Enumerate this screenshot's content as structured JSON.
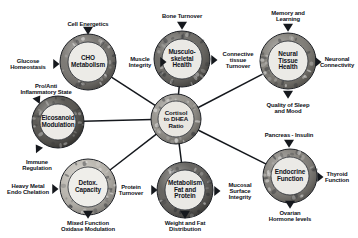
{
  "figure": {
    "background": "#ffffff",
    "text_color": "#10131a",
    "line_color": "#15181d"
  },
  "hub": {
    "id": "cortisol-dhea-ratio",
    "label": "Cortisol\nto DHEA\nRatio",
    "cx": 176,
    "cy": 119,
    "r_outer": 25,
    "r_inner": 18,
    "ring_fill": "#8e8b84",
    "center_fill": "#e9e7e1"
  },
  "nodes": [
    {
      "id": "cho-metabolism",
      "label": "CHO\nMetabolism",
      "cx": 88,
      "cy": 62,
      "r_outer": 28,
      "r_inner": 20,
      "ring_fill": "#6f6c67",
      "center_fill": "#ecebe7",
      "leaves": [
        {
          "id": "cell-energetics",
          "label": "Cell Energetics",
          "angle": -90,
          "lx": 88,
          "ly": 24,
          "ax": 88,
          "ay": 32,
          "dir": "down"
        },
        {
          "id": "glucose-homeostasis",
          "label": "Glucose\nHomeostasis",
          "angle": 180,
          "lx": 28,
          "ly": 64,
          "ax": 56,
          "ay": 64,
          "dir": "right"
        },
        {
          "id": "muscle-integrity",
          "label": "Muscle\nIntegrity",
          "angle": 0,
          "lx": 140,
          "ly": 62,
          "ax": 163,
          "ay": 62,
          "dir": "right"
        }
      ]
    },
    {
      "id": "musculoskeletal-health",
      "label": "Musculo-\nskeletal\nHealth",
      "cx": 182,
      "cy": 59,
      "r_outer": 28,
      "r_inner": 20,
      "ring_fill": "#5f5d58",
      "center_fill": "#eae9e5",
      "leaves": [
        {
          "id": "bone-turnover",
          "label": "Bone Turnover",
          "angle": -90,
          "lx": 182,
          "ly": 16,
          "ax": 182,
          "ay": 27,
          "dir": "down"
        },
        {
          "id": "muscle-integrity-ms",
          "label": "",
          "angle": 180,
          "lx": 0,
          "ly": 0,
          "ax": 0,
          "ay": 0,
          "dir": "none"
        },
        {
          "id": "connective-tissue-turnover",
          "label": "Connective\ntissue\nTurnover",
          "angle": 0,
          "lx": 238,
          "ly": 60,
          "ax": 214,
          "ay": 60,
          "dir": "right"
        }
      ]
    },
    {
      "id": "neural-tissue-health",
      "label": "Neural\nTissue\nHealth",
      "cx": 288,
      "cy": 61,
      "r_outer": 28,
      "r_inner": 20,
      "ring_fill": "#77746d",
      "center_fill": "#ebeae6",
      "leaves": [
        {
          "id": "memory-and-learning",
          "label": "Memory and\nLearning",
          "angle": -90,
          "lx": 288,
          "ly": 16,
          "ax": 288,
          "ay": 29,
          "dir": "down"
        },
        {
          "id": "neuronal-connectivity",
          "label": "Neuronal\nConnectivity",
          "angle": 0,
          "lx": 337,
          "ly": 62,
          "ax": 318,
          "ay": 62,
          "dir": "right"
        },
        {
          "id": "quality-of-sleep-and-mood",
          "label": "Quality of Sleep\nand Mood",
          "angle": 90,
          "lx": 288,
          "ly": 108,
          "ax": 288,
          "ay": 96,
          "dir": "down"
        }
      ]
    },
    {
      "id": "eicosanoid-modulation",
      "label": "Eicosanoid\nModulation",
      "cx": 58,
      "cy": 122,
      "r_outer": 26,
      "r_inner": 18,
      "ring_fill": "#4a4843",
      "center_fill": "#eceae6",
      "leaves": [
        {
          "id": "pro-anti-inflammatory-state",
          "label": "Pro/Anti\nInflammatory State",
          "angle": -135,
          "lx": 46,
          "ly": 89,
          "ax": 38,
          "ay": 101,
          "dir": "downright"
        },
        {
          "id": "immune-regulation",
          "label": "Immune\nRegulation",
          "angle": 135,
          "lx": 37,
          "ly": 165,
          "ax": 38,
          "ay": 150,
          "dir": "downleft"
        }
      ]
    },
    {
      "id": "detox-capacity",
      "label": "Detox.\nCapacity",
      "cx": 88,
      "cy": 187,
      "r_outer": 28,
      "r_inner": 20,
      "ring_fill": "#b6b2aa",
      "center_fill": "#efeeea",
      "leaves": [
        {
          "id": "heavy-metal-endo-chelation",
          "label": "Heavy Metal\nEndo Chelation",
          "angle": 180,
          "lx": 28,
          "ly": 189,
          "ax": 55,
          "ay": 189,
          "dir": "right"
        },
        {
          "id": "mixed-function-oxidase-modulation",
          "label": "Mixed Function\nOxidase Modulation",
          "angle": 90,
          "lx": 88,
          "ly": 226,
          "ax": 88,
          "ay": 216,
          "dir": "down"
        }
      ]
    },
    {
      "id": "metabolism-fat-and-protein",
      "label": "Metabolism\nFat and\nProtein",
      "cx": 185,
      "cy": 190,
      "r_outer": 28,
      "r_inner": 20,
      "ring_fill": "#565450",
      "center_fill": "#eae9e5",
      "leaves": [
        {
          "id": "protein-turnover",
          "label": "Protein\nTurnover",
          "angle": 180,
          "lx": 131,
          "ly": 190,
          "ax": 154,
          "ay": 190,
          "dir": "right"
        },
        {
          "id": "mucosal-surface-integrity",
          "label": "Mucosal\nSurface\nIntegrity",
          "angle": 0,
          "lx": 240,
          "ly": 191,
          "ax": 217,
          "ay": 191,
          "dir": "right"
        },
        {
          "id": "weight-and-fat-distribution",
          "label": "Weight and Fat\nDistribution",
          "angle": 90,
          "lx": 185,
          "ly": 226,
          "ax": 185,
          "ay": 216,
          "dir": "down"
        }
      ]
    },
    {
      "id": "endocrine-function",
      "label": "Endocrine\nFunction",
      "cx": 290,
      "cy": 176,
      "r_outer": 27,
      "r_inner": 19,
      "ring_fill": "#7a7771",
      "center_fill": "#ebeae6",
      "leaves": [
        {
          "id": "pancreas-insulin",
          "label": "Pancreas - Insulin",
          "angle": -90,
          "lx": 289,
          "ly": 135,
          "ax": 289,
          "ay": 145,
          "dir": "down"
        },
        {
          "id": "thyroid-function",
          "label": "Thyroid\nFunction",
          "angle": 0,
          "lx": 337,
          "ly": 177,
          "ax": 320,
          "ay": 177,
          "dir": "right"
        },
        {
          "id": "ovarian-hormone-levels",
          "label": "Ovarian\nHormone levels",
          "angle": 90,
          "lx": 290,
          "ly": 216,
          "ax": 290,
          "ay": 206,
          "dir": "down"
        }
      ]
    }
  ],
  "connections": [
    {
      "id": "hub-to-cho-metabolism",
      "from": "cortisol-dhea-ratio",
      "to": "cho-metabolism"
    },
    {
      "id": "hub-to-musculoskeletal-health",
      "from": "cortisol-dhea-ratio",
      "to": "musculoskeletal-health"
    },
    {
      "id": "hub-to-neural-tissue-health",
      "from": "cortisol-dhea-ratio",
      "to": "neural-tissue-health"
    },
    {
      "id": "hub-to-eicosanoid-modulation",
      "from": "cortisol-dhea-ratio",
      "to": "eicosanoid-modulation"
    },
    {
      "id": "hub-to-detox-capacity",
      "from": "cortisol-dhea-ratio",
      "to": "detox-capacity"
    },
    {
      "id": "hub-to-metabolism-fat-and-protein",
      "from": "cortisol-dhea-ratio",
      "to": "metabolism-fat-and-protein"
    },
    {
      "id": "hub-to-endocrine-function",
      "from": "cortisol-dhea-ratio",
      "to": "endocrine-function"
    }
  ],
  "labels": {
    "cell_energetics": "Cell Energetics",
    "glucose_homeostasis": "Glucose\nHomeostasis",
    "pro_anti_inflammatory_state": "Pro/Anti\nInflammatory State",
    "immune_regulation": "Immune\nRegulation",
    "heavy_metal_endo_chelation": "Heavy Metal\nEndo Chelation",
    "mixed_function_oxidase_modulation": "Mixed Function\nOxidase Modulation",
    "muscle_integrity": "Muscle\nIntegrity",
    "bone_turnover": "Bone Turnover",
    "connective_tissue_turnover": "Connective\ntissue\nTurnover",
    "memory_and_learning": "Memory and\nLearning",
    "neuronal_connectivity": "Neuronal\nConnectivity",
    "quality_of_sleep_and_mood": "Quality of Sleep\nand Mood",
    "protein_turnover": "Protein\nTurnover",
    "mucosal_surface_integrity": "Mucosal\nSurface\nIntegrity",
    "weight_and_fat_distribution": "Weight and Fat\nDistribution",
    "pancreas_insulin": "Pancreas - Insulin",
    "thyroid_function": "Thyroid\nFunction",
    "ovarian_hormone_levels": "Ovarian\nHormone levels"
  }
}
